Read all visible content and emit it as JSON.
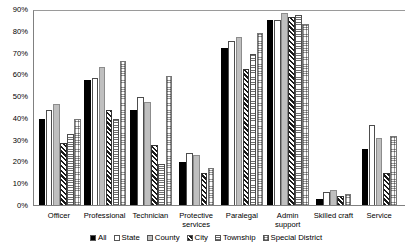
{
  "chart_data": {
    "type": "bar",
    "title": "",
    "xlabel": "",
    "ylabel": "",
    "ylim": [
      0,
      90
    ],
    "ytick_labels": [
      "90%",
      "80%",
      "70%",
      "60%",
      "50%",
      "40%",
      "30%",
      "20%",
      "10%",
      "0%"
    ],
    "ytick_values": [
      90,
      80,
      70,
      60,
      50,
      40,
      30,
      20,
      10,
      0
    ],
    "grid": false,
    "legend_position": "bottom",
    "categories": [
      "Officer",
      "Professional",
      "Technician",
      "Protective services",
      "Paralegal",
      "Admin support",
      "Skilled craft",
      "Service"
    ],
    "series": [
      {
        "name": "All",
        "pattern": "solid-black",
        "color": "#000000",
        "values": [
          40,
          58,
          44,
          20,
          73,
          86,
          3,
          26
        ]
      },
      {
        "name": "State",
        "pattern": "white",
        "color": "#ffffff",
        "values": [
          44,
          59,
          50,
          24,
          76,
          86,
          6,
          37
        ]
      },
      {
        "name": "County",
        "pattern": "light-gray",
        "color": "#bfbfbf",
        "values": [
          47,
          64,
          48,
          23,
          78,
          89,
          7,
          31
        ]
      },
      {
        "name": "City",
        "pattern": "diagonal-hatch",
        "color": "#1a1a1a",
        "values": [
          29,
          44,
          28,
          15,
          63,
          87,
          4,
          15
        ]
      },
      {
        "name": "Township",
        "pattern": "horizontal-lines",
        "color": "#6e6e6e",
        "values": [
          33,
          40,
          19,
          0,
          70,
          88,
          0,
          0
        ]
      },
      {
        "name": "Special District",
        "pattern": "fine-grid",
        "color": "#9a9a9a",
        "values": [
          40,
          67,
          60,
          17,
          80,
          84,
          5,
          32
        ]
      }
    ]
  }
}
